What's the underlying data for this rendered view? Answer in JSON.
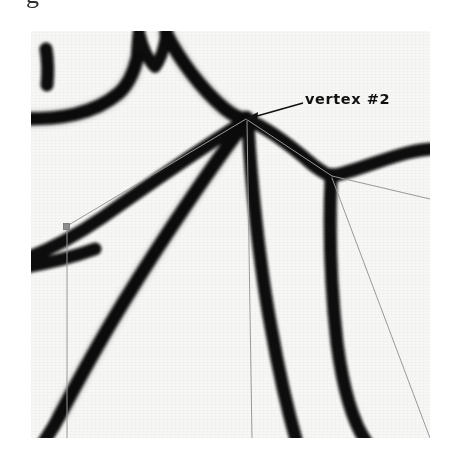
{
  "figure": {
    "caption_fragment": "g",
    "panel": {
      "background_color": "#f7f7f5",
      "ink_color": "#0a0a0a",
      "overlay_line_color": "#9a9a9a",
      "width": 399,
      "height": 407
    },
    "annotations": [
      {
        "id": "vertex-2",
        "label": "vertex #2",
        "label_x": 305,
        "label_y": 91,
        "arrow_from_x": 300,
        "arrow_from_y": 103,
        "arrow_to_x": 246,
        "arrow_to_y": 117
      }
    ],
    "vertices": [
      {
        "id": "v2",
        "x": 246,
        "y": 118,
        "marker": "junction"
      },
      {
        "id": "v3",
        "x": 332,
        "y": 176,
        "marker": "junction"
      },
      {
        "id": "v1",
        "x": 67,
        "y": 226,
        "marker": "square"
      }
    ],
    "overlay_edges": [
      {
        "from": "v2",
        "to": "v1"
      },
      {
        "from": "v2",
        "to": "v3"
      },
      {
        "from": "v2",
        "to": "bottom-center"
      },
      {
        "from": "v1",
        "to": "bottom-left"
      },
      {
        "from": "v3",
        "to": "bottom-right"
      }
    ],
    "ink_strokes": [
      {
        "name": "left-blob",
        "description": "short vertical blob near upper-left"
      },
      {
        "name": "upper-arc",
        "description": "broad arc rising from left edge to notched peak"
      },
      {
        "name": "peak-notch",
        "description": "V shaped notch at the top of the arc"
      },
      {
        "name": "peak-to-vertex2",
        "description": "descending stroke from peak down to vertex #2"
      },
      {
        "name": "vertex2-to-vertex3",
        "description": "stroke from vertex #2 right-down to vertex #3"
      },
      {
        "name": "vertex3-to-right-edge",
        "description": "stroke from vertex #3 to the right edge"
      },
      {
        "name": "branch-left-upper",
        "description": "stroke from vertex #2 down-left toward the left edge"
      },
      {
        "name": "branch-left-lower",
        "description": "stroke from vertex #2 down-left to the bottom-left"
      },
      {
        "name": "branch-down-center",
        "description": "stroke from vertex #2 down to the bottom edge"
      },
      {
        "name": "branch-down-right",
        "description": "stroke from vertex #3 down to the bottom edge"
      }
    ]
  }
}
